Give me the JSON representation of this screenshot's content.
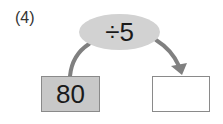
{
  "problem": {
    "number_label": "(4)",
    "operator": "÷5",
    "input_value": "80",
    "output_value": ""
  },
  "colors": {
    "operator_fill": "#d2d2d2",
    "input_fill": "#c8c8c8",
    "output_fill": "#ffffff",
    "arrow": "#808080",
    "border": "#8a8a8a"
  }
}
